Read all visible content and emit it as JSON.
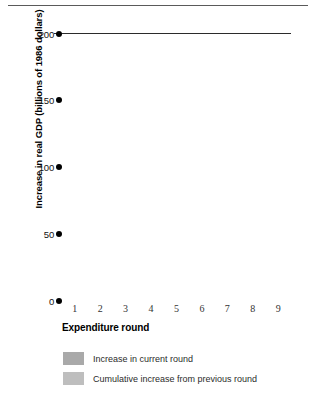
{
  "chart_data": {
    "type": "bar",
    "title": "",
    "xlabel": "Expenditure round",
    "ylabel": "Increase in real GDP (billions of 1986 dollars)",
    "categories": [
      "1",
      "2",
      "3",
      "4",
      "5",
      "6",
      "7",
      "8",
      "9"
    ],
    "ylim": [
      0,
      200
    ],
    "yticks": [
      0,
      50,
      100,
      150,
      200
    ],
    "ytick_labels": [
      "0",
      "50",
      "100",
      "150",
      "200"
    ],
    "grid": false,
    "legend_position": "bottom-left",
    "stacked": true,
    "series": [
      {
        "name": "Cumulative increase from previous round",
        "color": "#bebebe",
        "values": [
          0,
          120,
          165,
          186,
          195,
          198.8,
          199.7,
          199.9,
          200
        ]
      },
      {
        "name": "Increase in current round",
        "color": "#a9a9a9",
        "values": [
          120,
          45,
          21,
          9,
          3.8,
          1.2,
          0.3,
          0.1,
          0
        ]
      }
    ],
    "totals": [
      120,
      165,
      186,
      195,
      198.8,
      200,
      200,
      200,
      200
    ],
    "reference_line": {
      "value": 200,
      "color": "#2b2b2b"
    }
  },
  "axis": {
    "y_title": "Increase in real GDP (billions of 1986 dollars)",
    "x_title": "Expenditure round",
    "y_ticks": [
      {
        "label": "200",
        "value": 200
      },
      {
        "label": "150",
        "value": 150
      },
      {
        "label": "100",
        "value": 100
      },
      {
        "label": "50",
        "value": 50
      },
      {
        "label": "0",
        "value": 0
      }
    ],
    "x_ticks": [
      "1",
      "2",
      "3",
      "4",
      "5",
      "6",
      "7",
      "8",
      "9"
    ]
  },
  "legend": {
    "items": [
      {
        "label": "Increase in current round",
        "color": "#a9a9a9"
      },
      {
        "label": "Cumulative increase from previous round",
        "color": "#bebebe"
      }
    ]
  }
}
